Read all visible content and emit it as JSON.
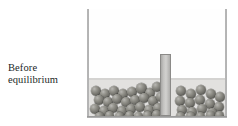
{
  "figure": {
    "kind": "equilibrium-beaker-diagram",
    "caption_lines": [
      "Before",
      "equilibrium"
    ],
    "caption_full": "Before equilibrium"
  },
  "colors": {
    "background": "#ffffff",
    "beaker_wall": "#9a9a9a",
    "liquid_fill": "#e2e1df",
    "headspace": "#fefefe",
    "divider_fill": "#c4c3c1",
    "divider_border": "#8b8a88",
    "molecule_dark": "#3e3e3b",
    "molecule_mid": "#73726c",
    "molecule_highlight": "#b9b8b4",
    "caption_text": "#221f1f"
  },
  "beaker": {
    "left": 87,
    "top": 9,
    "width": 140,
    "height": 109,
    "wall_thickness": 2,
    "liquid_top": 69,
    "liquid_height": 38
  },
  "divider": {
    "left": 73,
    "top": 45,
    "width": 11,
    "height": 62
  },
  "molecules": {
    "left_compartment_count": 31,
    "right_compartment_count": 19,
    "diameter_range": [
      8,
      11
    ],
    "left": [
      {
        "x": 2,
        "y": 8,
        "d": 10
      },
      {
        "x": 11,
        "y": 11,
        "d": 10
      },
      {
        "x": 20,
        "y": 8,
        "d": 10
      },
      {
        "x": 29,
        "y": 11,
        "d": 10
      },
      {
        "x": 38,
        "y": 9,
        "d": 10
      },
      {
        "x": 47,
        "y": 5,
        "d": 11
      },
      {
        "x": 56,
        "y": 10,
        "d": 10
      },
      {
        "x": 63,
        "y": 4,
        "d": 10
      },
      {
        "x": 5,
        "y": 17,
        "d": 10
      },
      {
        "x": 14,
        "y": 19,
        "d": 10
      },
      {
        "x": 23,
        "y": 16,
        "d": 10
      },
      {
        "x": 32,
        "y": 19,
        "d": 10
      },
      {
        "x": 41,
        "y": 17,
        "d": 10
      },
      {
        "x": 50,
        "y": 15,
        "d": 10
      },
      {
        "x": 59,
        "y": 18,
        "d": 10
      },
      {
        "x": 67,
        "y": 14,
        "d": 10
      },
      {
        "x": 1,
        "y": 26,
        "d": 10
      },
      {
        "x": 10,
        "y": 28,
        "d": 10
      },
      {
        "x": 19,
        "y": 25,
        "d": 10
      },
      {
        "x": 28,
        "y": 28,
        "d": 10
      },
      {
        "x": 37,
        "y": 26,
        "d": 10
      },
      {
        "x": 46,
        "y": 24,
        "d": 10
      },
      {
        "x": 55,
        "y": 27,
        "d": 10
      },
      {
        "x": 64,
        "y": 25,
        "d": 10
      },
      {
        "x": 6,
        "y": 34,
        "d": 9
      },
      {
        "x": 16,
        "y": 33,
        "d": 9
      },
      {
        "x": 26,
        "y": 34,
        "d": 9
      },
      {
        "x": 36,
        "y": 33,
        "d": 9
      },
      {
        "x": 45,
        "y": 34,
        "d": 9
      },
      {
        "x": 54,
        "y": 33,
        "d": 9
      },
      {
        "x": 63,
        "y": 32,
        "d": 9
      }
    ],
    "right": [
      {
        "x": 87,
        "y": 8,
        "d": 10
      },
      {
        "x": 97,
        "y": 11,
        "d": 10
      },
      {
        "x": 107,
        "y": 7,
        "d": 10
      },
      {
        "x": 117,
        "y": 11,
        "d": 10
      },
      {
        "x": 126,
        "y": 14,
        "d": 10
      },
      {
        "x": 86,
        "y": 18,
        "d": 10
      },
      {
        "x": 96,
        "y": 20,
        "d": 10
      },
      {
        "x": 106,
        "y": 17,
        "d": 10
      },
      {
        "x": 116,
        "y": 21,
        "d": 10
      },
      {
        "x": 125,
        "y": 24,
        "d": 10
      },
      {
        "x": 88,
        "y": 27,
        "d": 10
      },
      {
        "x": 98,
        "y": 29,
        "d": 10
      },
      {
        "x": 108,
        "y": 26,
        "d": 10
      },
      {
        "x": 118,
        "y": 30,
        "d": 10
      },
      {
        "x": 87,
        "y": 34,
        "d": 9
      },
      {
        "x": 97,
        "y": 34,
        "d": 9
      },
      {
        "x": 107,
        "y": 34,
        "d": 9
      },
      {
        "x": 117,
        "y": 33,
        "d": 9
      },
      {
        "x": 126,
        "y": 33,
        "d": 9
      }
    ]
  }
}
